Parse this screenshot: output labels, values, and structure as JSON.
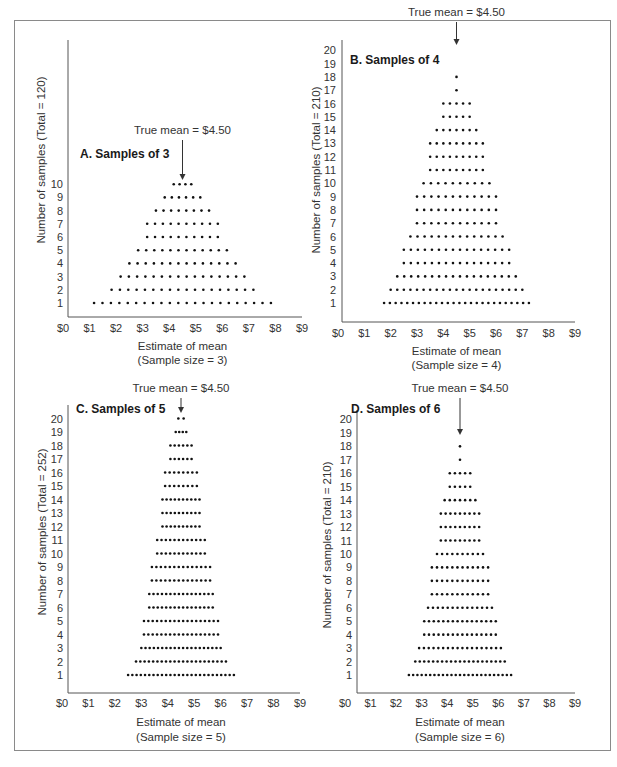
{
  "figure": {
    "mean_label": "True mean = $4.50",
    "x_tick_labels": [
      "$0",
      "$1",
      "$2",
      "$3",
      "$4",
      "$5",
      "$6",
      "$7",
      "$8",
      "$9"
    ],
    "dot_color": "#111111",
    "axis_color": "#555555"
  },
  "chart_data": [
    {
      "type": "dot-histogram",
      "panel": "A",
      "title": "A. Samples of 3",
      "annotation": "True mean = $4.50",
      "true_mean": 4.5,
      "xlabel": "Estimate of mean",
      "xlabel_sub": "(Sample size = 3)",
      "ylabel": "Number of samples (Total = 120)",
      "total": 120,
      "xlim": [
        0,
        9
      ],
      "x_ticks": [
        "$0",
        "$1",
        "$2",
        "$3",
        "$4",
        "$5",
        "$6",
        "$7",
        "$8",
        "$9"
      ],
      "y_ticks": [
        1,
        2,
        3,
        4,
        5,
        6,
        7,
        8,
        9,
        10
      ],
      "rows": [
        {
          "y": 1,
          "count": 22,
          "x_min": 1.17,
          "x_max": 7.83
        },
        {
          "y": 2,
          "count": 18,
          "x_min": 1.83,
          "x_max": 7.17
        },
        {
          "y": 3,
          "count": 16,
          "x_min": 2.17,
          "x_max": 6.83
        },
        {
          "y": 4,
          "count": 14,
          "x_min": 2.5,
          "x_max": 6.5
        },
        {
          "y": 5,
          "count": 12,
          "x_min": 2.83,
          "x_max": 6.17
        },
        {
          "y": 6,
          "count": 10,
          "x_min": 3.17,
          "x_max": 5.83
        },
        {
          "y": 7,
          "count": 10,
          "x_min": 3.17,
          "x_max": 5.83
        },
        {
          "y": 8,
          "count": 8,
          "x_min": 3.5,
          "x_max": 5.5
        },
        {
          "y": 9,
          "count": 6,
          "x_min": 3.83,
          "x_max": 5.17
        },
        {
          "y": 10,
          "count": 4,
          "x_min": 4.17,
          "x_max": 4.83
        }
      ]
    },
    {
      "type": "dot-histogram",
      "panel": "B",
      "title": "B. Samples of 4",
      "annotation": "True mean = $4.50",
      "true_mean": 4.5,
      "xlabel": "Estimate of mean",
      "xlabel_sub": "(Sample size = 4)",
      "ylabel": "Number of samples (Total = 210)",
      "total": 210,
      "xlim": [
        0,
        9
      ],
      "x_ticks": [
        "$0",
        "$1",
        "$2",
        "$3",
        "$4",
        "$5",
        "$6",
        "$7",
        "$8",
        "$9"
      ],
      "y_ticks": [
        1,
        2,
        3,
        4,
        5,
        6,
        7,
        8,
        9,
        10,
        11,
        12,
        13,
        14,
        15,
        16,
        17,
        18,
        19,
        20
      ],
      "rows": [
        {
          "y": 1,
          "count": 26,
          "x_min": 1.75,
          "x_max": 7.25
        },
        {
          "y": 2,
          "count": 21,
          "x_min": 2.0,
          "x_max": 7.0
        },
        {
          "y": 3,
          "count": 18,
          "x_min": 2.25,
          "x_max": 6.75
        },
        {
          "y": 4,
          "count": 16,
          "x_min": 2.5,
          "x_max": 6.5
        },
        {
          "y": 5,
          "count": 16,
          "x_min": 2.5,
          "x_max": 6.5
        },
        {
          "y": 6,
          "count": 14,
          "x_min": 2.75,
          "x_max": 6.25
        },
        {
          "y": 7,
          "count": 12,
          "x_min": 3.0,
          "x_max": 6.0
        },
        {
          "y": 8,
          "count": 12,
          "x_min": 3.0,
          "x_max": 6.0
        },
        {
          "y": 9,
          "count": 12,
          "x_min": 3.0,
          "x_max": 6.0
        },
        {
          "y": 10,
          "count": 10,
          "x_min": 3.25,
          "x_max": 5.75
        },
        {
          "y": 11,
          "count": 9,
          "x_min": 3.5,
          "x_max": 5.5
        },
        {
          "y": 12,
          "count": 9,
          "x_min": 3.5,
          "x_max": 5.5
        },
        {
          "y": 13,
          "count": 9,
          "x_min": 3.5,
          "x_max": 5.5
        },
        {
          "y": 14,
          "count": 7,
          "x_min": 3.75,
          "x_max": 5.25
        },
        {
          "y": 15,
          "count": 5,
          "x_min": 4.0,
          "x_max": 5.0
        },
        {
          "y": 16,
          "count": 5,
          "x_min": 4.0,
          "x_max": 5.0
        },
        {
          "y": 17,
          "count": 1,
          "x_min": 4.5,
          "x_max": 4.5
        },
        {
          "y": 18,
          "count": 1,
          "x_min": 4.5,
          "x_max": 4.5
        }
      ]
    },
    {
      "type": "dot-histogram",
      "panel": "C",
      "title": "C. Samples of 5",
      "annotation": "True mean = $4.50",
      "true_mean": 4.5,
      "xlabel": "Estimate of mean",
      "xlabel_sub": "(Sample size = 5)",
      "ylabel": "Number of samples (Total = 252)",
      "total": 252,
      "xlim": [
        0,
        9
      ],
      "x_ticks": [
        "$0",
        "$1",
        "$2",
        "$3",
        "$4",
        "$5",
        "$6",
        "$7",
        "$8",
        "$9"
      ],
      "y_ticks": [
        1,
        2,
        3,
        4,
        5,
        6,
        7,
        8,
        9,
        10,
        11,
        12,
        13,
        14,
        15,
        16,
        17,
        18,
        19,
        20
      ],
      "rows": [
        {
          "y": 1,
          "count": 26,
          "x_min": 2.5,
          "x_max": 6.5
        },
        {
          "y": 2,
          "count": 22,
          "x_min": 2.8,
          "x_max": 6.2
        },
        {
          "y": 3,
          "count": 20,
          "x_min": 3.0,
          "x_max": 6.0
        },
        {
          "y": 4,
          "count": 18,
          "x_min": 3.1,
          "x_max": 5.9
        },
        {
          "y": 5,
          "count": 18,
          "x_min": 3.1,
          "x_max": 5.9
        },
        {
          "y": 6,
          "count": 16,
          "x_min": 3.3,
          "x_max": 5.7
        },
        {
          "y": 7,
          "count": 16,
          "x_min": 3.3,
          "x_max": 5.7
        },
        {
          "y": 8,
          "count": 14,
          "x_min": 3.4,
          "x_max": 5.6
        },
        {
          "y": 9,
          "count": 14,
          "x_min": 3.4,
          "x_max": 5.6
        },
        {
          "y": 10,
          "count": 12,
          "x_min": 3.6,
          "x_max": 5.4
        },
        {
          "y": 11,
          "count": 12,
          "x_min": 3.6,
          "x_max": 5.4
        },
        {
          "y": 12,
          "count": 10,
          "x_min": 3.8,
          "x_max": 5.2
        },
        {
          "y": 13,
          "count": 10,
          "x_min": 3.8,
          "x_max": 5.2
        },
        {
          "y": 14,
          "count": 10,
          "x_min": 3.8,
          "x_max": 5.2
        },
        {
          "y": 15,
          "count": 8,
          "x_min": 3.9,
          "x_max": 5.1
        },
        {
          "y": 16,
          "count": 8,
          "x_min": 3.9,
          "x_max": 5.1
        },
        {
          "y": 17,
          "count": 6,
          "x_min": 4.1,
          "x_max": 4.9
        },
        {
          "y": 18,
          "count": 6,
          "x_min": 4.1,
          "x_max": 4.9
        },
        {
          "y": 19,
          "count": 4,
          "x_min": 4.3,
          "x_max": 4.7
        },
        {
          "y": 20,
          "count": 2,
          "x_min": 4.4,
          "x_max": 4.6
        }
      ]
    },
    {
      "type": "dot-histogram",
      "panel": "D",
      "title": "D. Samples of 6",
      "annotation": "True mean = $4.50",
      "true_mean": 4.5,
      "xlabel": "Estimate of mean",
      "xlabel_sub": "(Sample size = 6)",
      "ylabel": "Number of samples (Total = 210)",
      "total": 210,
      "xlim": [
        0,
        9
      ],
      "x_ticks": [
        "$0",
        "$1",
        "$2",
        "$3",
        "$4",
        "$5",
        "$6",
        "$7",
        "$8",
        "$9"
      ],
      "y_ticks": [
        1,
        2,
        3,
        4,
        5,
        6,
        7,
        8,
        9,
        10,
        11,
        12,
        13,
        14,
        15,
        16,
        17,
        18,
        19,
        20
      ],
      "rows": [
        {
          "y": 1,
          "count": 25,
          "x_min": 2.5,
          "x_max": 6.5
        },
        {
          "y": 2,
          "count": 21,
          "x_min": 2.75,
          "x_max": 6.25
        },
        {
          "y": 3,
          "count": 18,
          "x_min": 2.9,
          "x_max": 6.1
        },
        {
          "y": 4,
          "count": 16,
          "x_min": 3.1,
          "x_max": 5.9
        },
        {
          "y": 5,
          "count": 16,
          "x_min": 3.1,
          "x_max": 5.9
        },
        {
          "y": 6,
          "count": 14,
          "x_min": 3.25,
          "x_max": 5.75
        },
        {
          "y": 7,
          "count": 12,
          "x_min": 3.4,
          "x_max": 5.6
        },
        {
          "y": 8,
          "count": 12,
          "x_min": 3.4,
          "x_max": 5.6
        },
        {
          "y": 9,
          "count": 12,
          "x_min": 3.4,
          "x_max": 5.6
        },
        {
          "y": 10,
          "count": 10,
          "x_min": 3.6,
          "x_max": 5.4
        },
        {
          "y": 11,
          "count": 9,
          "x_min": 3.75,
          "x_max": 5.25
        },
        {
          "y": 12,
          "count": 9,
          "x_min": 3.75,
          "x_max": 5.25
        },
        {
          "y": 13,
          "count": 9,
          "x_min": 3.75,
          "x_max": 5.25
        },
        {
          "y": 14,
          "count": 7,
          "x_min": 3.9,
          "x_max": 5.1
        },
        {
          "y": 15,
          "count": 5,
          "x_min": 4.1,
          "x_max": 4.9
        },
        {
          "y": 16,
          "count": 5,
          "x_min": 4.1,
          "x_max": 4.9
        },
        {
          "y": 17,
          "count": 1,
          "x_min": 4.5,
          "x_max": 4.5
        },
        {
          "y": 18,
          "count": 1,
          "x_min": 4.5,
          "x_max": 4.5
        }
      ]
    }
  ]
}
